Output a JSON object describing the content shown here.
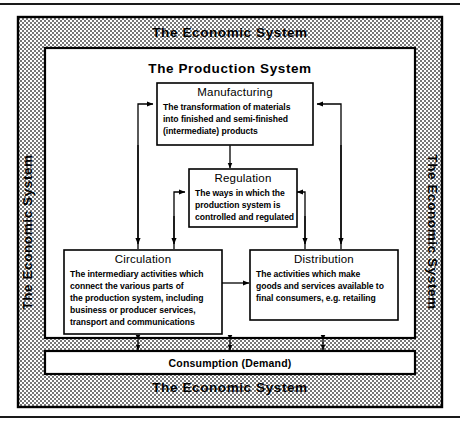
{
  "figure": {
    "outer_border_color": "#000000",
    "stipple_color": "#000000",
    "background": "#ffffff"
  },
  "economic_system": {
    "top_label": "The Economic System",
    "bottom_label": "The Economic System",
    "left_label": "The Economic System",
    "right_label": "The Economic System"
  },
  "production_system": {
    "title": "The Production System"
  },
  "boxes": {
    "manufacturing": {
      "title": "Manufacturing",
      "lines": [
        "The transformation of materials",
        "into finished and semi-finished",
        "(intermediate) products"
      ]
    },
    "regulation": {
      "title": "Regulation",
      "lines": [
        "The ways in which the",
        "production system is",
        "controlled and regulated"
      ]
    },
    "circulation": {
      "title": "Circulation",
      "lines": [
        "The intermediary activities which",
        "connect the various parts of",
        "the production system, including",
        "business or producer services,",
        "transport and communications"
      ]
    },
    "distribution": {
      "title": "Distribution",
      "lines": [
        "The activities which make",
        "goods and services available to",
        "final consumers, e.g. retailing"
      ]
    },
    "consumption": {
      "title": "Consumption (Demand)"
    }
  }
}
